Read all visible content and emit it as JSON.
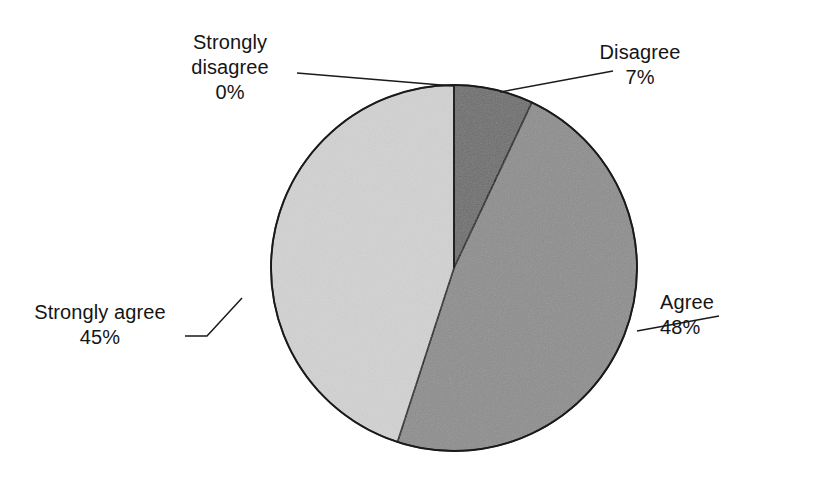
{
  "figure": {
    "background_color": "#ffffff",
    "outline_color": "#1a1a1a",
    "width": 818,
    "height": 479
  },
  "chart_data": {
    "type": "pie",
    "title": "",
    "subtitle": "",
    "xlabel": "",
    "ylabel": "",
    "legend_position": "none",
    "grid": false,
    "start_angle_deg": 0,
    "direction": "clockwise",
    "categories": [
      "Strongly disagree",
      "Disagree",
      "Agree",
      "Strongly agree"
    ],
    "values": [
      0,
      7,
      48,
      45
    ],
    "value_unit": "%",
    "slices": [
      {
        "label": "Strongly disagree",
        "value": 0,
        "value_text": "0%",
        "color": "#ffffff",
        "visible": false,
        "leader_label_side": "top-left"
      },
      {
        "label": "Disagree",
        "value": 7,
        "value_text": "7%",
        "color": "#6d6d6d",
        "visible": true,
        "leader_label_side": "top-right"
      },
      {
        "label": "Agree",
        "value": 48,
        "value_text": "48%",
        "color": "#8d8d8d",
        "visible": true,
        "leader_label_side": "right"
      },
      {
        "label": "Strongly agree",
        "value": 45,
        "value_text": "45%",
        "color": "#d2d2d2",
        "visible": true,
        "leader_label_side": "left"
      }
    ]
  },
  "labels": {
    "strongly_disagree": {
      "line1": "Strongly",
      "line2": "disagree",
      "percent": "0%"
    },
    "disagree": {
      "line1": "Disagree",
      "percent": "7%"
    },
    "agree": {
      "line1": "Agree",
      "percent": "48%"
    },
    "strongly_agree": {
      "line1": "Strongly agree",
      "percent": "45%"
    }
  }
}
